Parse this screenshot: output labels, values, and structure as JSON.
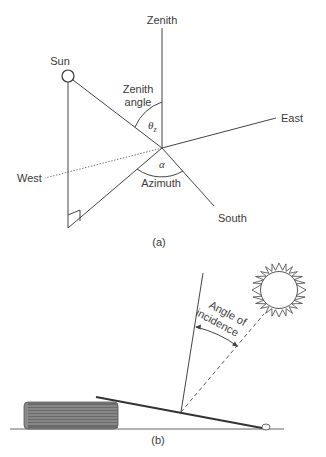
{
  "figure_a": {
    "caption": "(a)",
    "labels": {
      "zenith": "Zenith",
      "sun": "Sun",
      "zenith_angle_line1": "Zenith",
      "zenith_angle_line2": "angle",
      "theta": "θ",
      "theta_sub": "z",
      "east": "East",
      "west": "West",
      "alpha": "α",
      "azimuth": "Azimuth",
      "south": "South"
    }
  },
  "figure_b": {
    "caption": "(b)",
    "labels": {
      "angle_line1": "Angle of",
      "angle_line2": "incidence"
    }
  },
  "colors": {
    "line": "#444444",
    "text": "#3a3a3a",
    "book": "#6a6a6a",
    "background": "#ffffff"
  }
}
